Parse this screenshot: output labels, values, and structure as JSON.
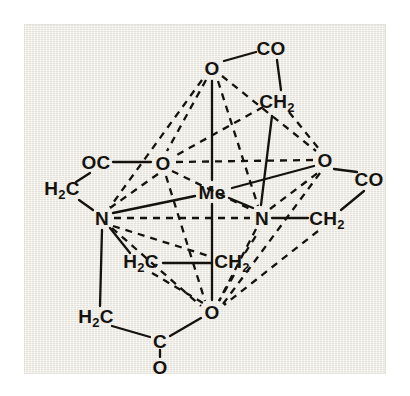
{
  "figure": {
    "type": "chemical-structure",
    "background_color": "#efece3",
    "line_color": "#15120e",
    "page_color": "#ffffff"
  },
  "atoms": [
    {
      "id": "o_top",
      "label": "O",
      "sub": "",
      "x": 212,
      "y": 68,
      "role": "coordinating-oxygen"
    },
    {
      "id": "co_top",
      "label": "CO",
      "sub": "",
      "x": 271,
      "y": 48,
      "role": "carbonyl-carbon"
    },
    {
      "id": "ch2_top",
      "label": "CH",
      "sub": "2",
      "x": 277,
      "y": 103,
      "role": "methylene-carbon"
    },
    {
      "id": "oc_left",
      "label": "OC",
      "sub": "",
      "x": 96,
      "y": 162,
      "role": "carbonyl-carbon"
    },
    {
      "id": "o_left",
      "label": "O",
      "sub": "",
      "x": 163,
      "y": 163,
      "role": "coordinating-oxygen"
    },
    {
      "id": "o_right",
      "label": "O",
      "sub": "",
      "x": 325,
      "y": 160,
      "role": "coordinating-oxygen"
    },
    {
      "id": "co_right",
      "label": "CO",
      "sub": "",
      "x": 369,
      "y": 179,
      "role": "carbonyl-carbon"
    },
    {
      "id": "h2c_left",
      "label": "H",
      "sub": "2",
      "x": 62,
      "y": 190,
      "role": "methylene-carbon",
      "suffix": "C"
    },
    {
      "id": "me_center",
      "label": "Me",
      "sub": "",
      "x": 212,
      "y": 192,
      "role": "central-metal"
    },
    {
      "id": "n_left",
      "label": "N",
      "sub": "",
      "x": 102,
      "y": 218,
      "role": "coordinating-nitrogen"
    },
    {
      "id": "n_right",
      "label": "N",
      "sub": "",
      "x": 262,
      "y": 218,
      "role": "coordinating-nitrogen"
    },
    {
      "id": "ch2_right",
      "label": "CH",
      "sub": "2",
      "x": 327,
      "y": 220,
      "role": "methylene-carbon"
    },
    {
      "id": "h2c_mid",
      "label": "H",
      "sub": "2",
      "x": 141,
      "y": 263,
      "role": "methylene-carbon",
      "suffix": "C"
    },
    {
      "id": "ch2_mid",
      "label": "CH",
      "sub": "2",
      "x": 232,
      "y": 263,
      "role": "methylene-carbon"
    },
    {
      "id": "h2c_low",
      "label": "H",
      "sub": "2",
      "x": 96,
      "y": 318,
      "role": "methylene-carbon",
      "suffix": "C"
    },
    {
      "id": "o_bottom",
      "label": "O",
      "sub": "",
      "x": 212,
      "y": 312,
      "role": "coordinating-oxygen"
    },
    {
      "id": "c_bottom",
      "label": "C",
      "sub": "",
      "x": 160,
      "y": 341,
      "role": "carboxyl-carbon"
    },
    {
      "id": "o_carbonyl",
      "label": "O",
      "sub": "",
      "x": 160,
      "y": 367,
      "role": "carbonyl-oxygen"
    }
  ],
  "bonds_solid": [
    {
      "from": "o_top",
      "to": "co_top",
      "x1": 224,
      "y1": 61,
      "x2": 256,
      "y2": 52
    },
    {
      "from": "co_top",
      "to": "ch2_top",
      "x1": 277,
      "y1": 60,
      "x2": 281,
      "y2": 90
    },
    {
      "from": "o_top",
      "to": "me_center",
      "x1": 212,
      "y1": 81,
      "x2": 212,
      "y2": 180
    },
    {
      "from": "ch2_top",
      "to": "n_right",
      "x1": 272,
      "y1": 116,
      "x2": 261,
      "y2": 205
    },
    {
      "from": "oc_left",
      "to": "o_left",
      "x1": 113,
      "y1": 162,
      "x2": 151,
      "y2": 162
    },
    {
      "from": "oc_left",
      "to": "h2c_left",
      "x1": 90,
      "y1": 173,
      "x2": 76,
      "y2": 182
    },
    {
      "from": "h2c_left",
      "to": "n_left",
      "x1": 79,
      "y1": 200,
      "x2": 93,
      "y2": 210
    },
    {
      "from": "o_right",
      "to": "co_right",
      "x1": 334,
      "y1": 169,
      "x2": 357,
      "y2": 172
    },
    {
      "from": "co_right",
      "to": "ch2_right",
      "x1": 364,
      "y1": 191,
      "x2": 341,
      "y2": 210
    },
    {
      "from": "n_right",
      "to": "ch2_right",
      "x1": 272,
      "y1": 218,
      "x2": 308,
      "y2": 218
    },
    {
      "from": "me_center",
      "to": "n_left",
      "x1": 195,
      "y1": 196,
      "x2": 113,
      "y2": 213
    },
    {
      "from": "me_center",
      "to": "n_right",
      "x1": 229,
      "y1": 198,
      "x2": 253,
      "y2": 208
    },
    {
      "from": "me_center",
      "to": "o_right",
      "x1": 232,
      "y1": 188,
      "x2": 314,
      "y2": 166
    },
    {
      "from": "me_center",
      "to": "o_bottom",
      "x1": 212,
      "y1": 204,
      "x2": 212,
      "y2": 300
    },
    {
      "from": "n_left",
      "to": "h2c_mid",
      "x1": 110,
      "y1": 228,
      "x2": 130,
      "y2": 253
    },
    {
      "from": "n_left",
      "to": "h2c_low",
      "x1": 102,
      "y1": 230,
      "x2": 100,
      "y2": 306
    },
    {
      "from": "h2c_mid",
      "to": "ch2_mid",
      "x1": 163,
      "y1": 263,
      "x2": 212,
      "y2": 263
    },
    {
      "from": "h2c_low",
      "to": "c_bottom",
      "x1": 112,
      "y1": 326,
      "x2": 150,
      "y2": 337
    },
    {
      "from": "c_bottom",
      "to": "o_bottom",
      "x1": 170,
      "y1": 336,
      "x2": 201,
      "y2": 318
    },
    {
      "from": "c_bottom",
      "to": "o_carbonyl",
      "x1": 160,
      "y1": 350,
      "x2": 160,
      "y2": 357
    }
  ],
  "bonds_dashed": [
    {
      "from": "o_top",
      "to": "o_left",
      "x1": 206,
      "y1": 80,
      "x2": 167,
      "y2": 151
    },
    {
      "from": "o_top",
      "to": "n_left",
      "x1": 202,
      "y1": 80,
      "x2": 110,
      "y2": 207
    },
    {
      "from": "o_top",
      "to": "n_right",
      "x1": 218,
      "y1": 81,
      "x2": 258,
      "y2": 206
    },
    {
      "from": "o_top",
      "to": "o_right",
      "x1": 222,
      "y1": 76,
      "x2": 316,
      "y2": 151
    },
    {
      "from": "o_left",
      "to": "n_left",
      "x1": 158,
      "y1": 174,
      "x2": 110,
      "y2": 208
    },
    {
      "from": "o_left",
      "to": "n_right",
      "x1": 172,
      "y1": 171,
      "x2": 252,
      "y2": 210
    },
    {
      "from": "o_left",
      "to": "o_right",
      "x1": 176,
      "y1": 162,
      "x2": 313,
      "y2": 160
    },
    {
      "from": "o_left",
      "to": "o_bottom",
      "x1": 166,
      "y1": 176,
      "x2": 205,
      "y2": 301
    },
    {
      "from": "n_left",
      "to": "n_right",
      "x1": 114,
      "y1": 218,
      "x2": 250,
      "y2": 218
    },
    {
      "from": "n_left",
      "to": "o_bottom",
      "x1": 112,
      "y1": 228,
      "x2": 201,
      "y2": 306
    },
    {
      "from": "n_right",
      "to": "o_right",
      "x1": 270,
      "y1": 209,
      "x2": 319,
      "y2": 172
    },
    {
      "from": "n_right",
      "to": "o_bottom",
      "x1": 256,
      "y1": 229,
      "x2": 219,
      "y2": 301
    },
    {
      "from": "o_right",
      "to": "o_bottom",
      "x1": 320,
      "y1": 173,
      "x2": 223,
      "y2": 304
    },
    {
      "from": "ch2_top",
      "to": "o_right",
      "x1": 289,
      "y1": 112,
      "x2": 319,
      "y2": 149
    },
    {
      "from": "ch2_top",
      "to": "o_left",
      "x1": 263,
      "y1": 107,
      "x2": 175,
      "y2": 156
    },
    {
      "from": "h2c_mid",
      "to": "o_bottom",
      "x1": 152,
      "y1": 273,
      "x2": 203,
      "y2": 303
    },
    {
      "from": "ch2_mid",
      "to": "o_bottom",
      "x1": 234,
      "y1": 275,
      "x2": 219,
      "y2": 301
    },
    {
      "from": "n_left",
      "to": "ch2_mid",
      "x1": 113,
      "y1": 226,
      "x2": 212,
      "y2": 257
    },
    {
      "from": "ch2_right",
      "to": "o_bottom",
      "x1": 318,
      "y1": 231,
      "x2": 224,
      "y2": 305
    },
    {
      "from": "ch2_mid",
      "to": "n_right",
      "x1": 245,
      "y1": 253,
      "x2": 259,
      "y2": 231
    }
  ]
}
